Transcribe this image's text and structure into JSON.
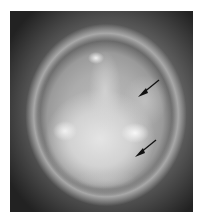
{
  "image": {
    "description": "Grayscale otoscopic photograph of a tympanic membrane with two black arrows pointing at lesions",
    "colors": {
      "background": "#ffffff",
      "dark_border": "#2a2a2a",
      "membrane": "#b0b0b0",
      "highlight": "#f0f0f0",
      "arrow": "#111111"
    },
    "annotations": [
      {
        "type": "arrow",
        "direction": "down-left",
        "tip": [
          138,
          95
        ]
      },
      {
        "type": "arrow",
        "direction": "down-left",
        "tip": [
          135,
          155
        ]
      }
    ]
  }
}
